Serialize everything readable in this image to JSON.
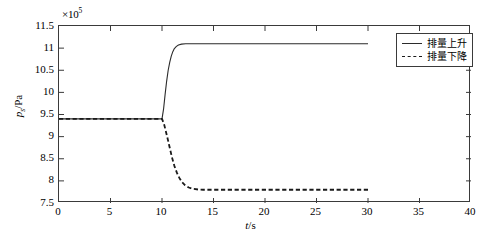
{
  "chart_data": {
    "type": "line",
    "title": "",
    "xlabel": "t/s",
    "ylabel": "p_s/Pa",
    "y_exponent_label": "×10",
    "y_exponent_power": "5",
    "xlim": [
      0,
      40
    ],
    "ylim": [
      7.5,
      11.5
    ],
    "xticks": [
      0,
      5,
      10,
      15,
      20,
      25,
      30,
      35,
      40
    ],
    "xtick_labels": [
      "0",
      "5",
      "10",
      "15",
      "20",
      "25",
      "30",
      "35",
      "40"
    ],
    "yticks": [
      7.5,
      8,
      8.5,
      9,
      9.5,
      10,
      10.5,
      11,
      11.5
    ],
    "ytick_labels": [
      "7.5",
      "8",
      "8.5",
      "9",
      "9.5",
      "10",
      "10.5",
      "11",
      "11.5"
    ],
    "grid": false,
    "legend_position": "upper right inside",
    "series": [
      {
        "name": "排量上升",
        "style": "solid",
        "color": "#2b2b2b",
        "initial_value": 9.4,
        "final_value": 11.1,
        "step_time": 10,
        "x_end": 30,
        "points": [
          [
            0,
            9.4
          ],
          [
            2,
            9.4
          ],
          [
            4,
            9.4
          ],
          [
            6,
            9.4
          ],
          [
            8,
            9.4
          ],
          [
            9.5,
            9.4
          ],
          [
            10,
            9.4
          ],
          [
            10.15,
            9.62
          ],
          [
            10.3,
            9.95
          ],
          [
            10.45,
            10.25
          ],
          [
            10.6,
            10.5
          ],
          [
            10.75,
            10.68
          ],
          [
            10.9,
            10.82
          ],
          [
            11.05,
            10.92
          ],
          [
            11.2,
            10.99
          ],
          [
            11.4,
            11.04
          ],
          [
            11.6,
            11.07
          ],
          [
            11.9,
            11.09
          ],
          [
            12.3,
            11.1
          ],
          [
            13,
            11.1
          ],
          [
            14,
            11.1
          ],
          [
            16,
            11.1
          ],
          [
            18,
            11.1
          ],
          [
            20,
            11.1
          ],
          [
            22,
            11.1
          ],
          [
            24,
            11.1
          ],
          [
            26,
            11.1
          ],
          [
            28,
            11.1
          ],
          [
            30,
            11.1
          ]
        ]
      },
      {
        "name": "排量下降",
        "style": "dashed",
        "color": "#1a1a1a",
        "initial_value": 9.4,
        "final_value": 7.8,
        "step_time": 10,
        "x_end": 30,
        "points": [
          [
            0,
            9.4
          ],
          [
            2,
            9.4
          ],
          [
            4,
            9.4
          ],
          [
            6,
            9.4
          ],
          [
            8,
            9.4
          ],
          [
            9.5,
            9.4
          ],
          [
            10,
            9.4
          ],
          [
            10.2,
            9.28
          ],
          [
            10.45,
            9.05
          ],
          [
            10.7,
            8.8
          ],
          [
            10.95,
            8.55
          ],
          [
            11.2,
            8.34
          ],
          [
            11.45,
            8.18
          ],
          [
            11.7,
            8.06
          ],
          [
            11.95,
            7.97
          ],
          [
            12.25,
            7.9
          ],
          [
            12.6,
            7.85
          ],
          [
            13,
            7.82
          ],
          [
            13.5,
            7.805
          ],
          [
            14,
            7.8
          ],
          [
            16,
            7.8
          ],
          [
            18,
            7.8
          ],
          [
            20,
            7.8
          ],
          [
            22,
            7.8
          ],
          [
            24,
            7.8
          ],
          [
            26,
            7.8
          ],
          [
            28,
            7.8
          ],
          [
            30,
            7.8
          ]
        ]
      }
    ]
  },
  "legend": {
    "entries": [
      {
        "label": "排量上升",
        "style": "solid"
      },
      {
        "label": "排量下降",
        "style": "dashed"
      }
    ]
  },
  "axes": {
    "x_title_var": "t",
    "x_title_unit": "/s",
    "y_title_var": "p",
    "y_title_sub": "s",
    "y_title_unit": "/Pa"
  }
}
